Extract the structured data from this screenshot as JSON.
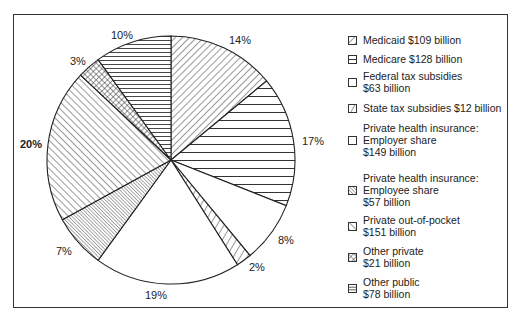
{
  "chart_data": {
    "type": "pie",
    "title": "",
    "unit": "percent of total",
    "start_angle_deg": 0,
    "direction": "clockwise",
    "legend_position": "right",
    "slices": [
      {
        "key": "medicaid",
        "label": "Medicaid",
        "amount": "$109 billion",
        "percent": 14,
        "pattern": "diag-right"
      },
      {
        "key": "medicare",
        "label": "Medicare",
        "amount": "$128 billion",
        "percent": 17,
        "pattern": "horizontal"
      },
      {
        "key": "federal_tax",
        "label": "Federal tax subsidies",
        "amount": "$63 billion",
        "percent": 8,
        "pattern": "blank"
      },
      {
        "key": "state_tax",
        "label": "State tax subsidies",
        "amount": "$12 billion",
        "percent": 2,
        "pattern": "diag-right-wide"
      },
      {
        "key": "employer",
        "label": "Private health insurance: Employer share",
        "amount": "$149 billion",
        "percent": 19,
        "pattern": "blank"
      },
      {
        "key": "employee",
        "label": "Private health insurance: Employee share",
        "amount": "$57 billion",
        "percent": 7,
        "pattern": "diag-left-dense"
      },
      {
        "key": "out_of_pocket",
        "label": "Private out-of-pocket",
        "amount": "$151 billion",
        "percent": 20,
        "pattern": "diag-left"
      },
      {
        "key": "other_private",
        "label": "Other private",
        "amount": "$21 billion",
        "percent": 3,
        "pattern": "crosshatch"
      },
      {
        "key": "other_public",
        "label": "Other public",
        "amount": "$78 billion",
        "percent": 10,
        "pattern": "horizontal-dense"
      }
    ]
  },
  "labels": {
    "medicaid": "14%",
    "medicare": "17%",
    "federal_tax": "8%",
    "state_tax": "2%",
    "employer": "19%",
    "employee": "7%",
    "out_of_pocket": "20%",
    "other_private": "3%",
    "other_public": "10%"
  },
  "legend": {
    "medicaid": [
      "Medicaid $109 billion"
    ],
    "medicare": [
      "Medicare $128 billion"
    ],
    "federal_tax": [
      "Federal tax subsidies",
      "$63 billion"
    ],
    "state_tax": [
      "State tax subsidies $12 billion"
    ],
    "employer": [
      "Private health insurance:",
      "Employer share",
      "$149 billion"
    ],
    "employee": [
      "Private health insurance:",
      "Employee share",
      "$57 billion"
    ],
    "out_of_pocket": [
      "Private out-of-pocket",
      "$151 billion"
    ],
    "other_private": [
      "Other private",
      "$21 billion"
    ],
    "other_public": [
      "Other public",
      "$78 billion"
    ]
  }
}
